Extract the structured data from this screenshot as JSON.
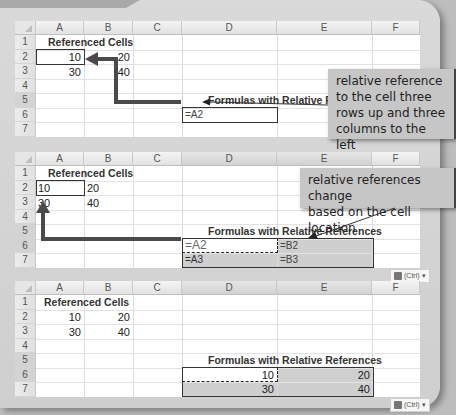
{
  "columns": [
    "A",
    "B",
    "C",
    "D",
    "E",
    "F"
  ],
  "rows": [
    "1",
    "2",
    "3",
    "4",
    "5",
    "6",
    "7"
  ],
  "panel1": {
    "heading": "Referenced Cells",
    "a2": "10",
    "b2": "20",
    "a3": "30",
    "b3": "40",
    "formulas_heading": "Formulas with Relative Refe",
    "d5": "=A2",
    "callout": [
      "relative reference",
      "to the cell three",
      "rows up and three",
      "columns to the left"
    ]
  },
  "panel2": {
    "heading": "Referenced Cells",
    "a2": "10",
    "b2": "20",
    "a3": "30",
    "b3": "40",
    "formulas_heading": "Formulas with Relative References",
    "d5": "=A2",
    "e5": "=B2",
    "d6": "=A3",
    "e6": "=B3",
    "callout": [
      "relative references change",
      "based on the cell location"
    ],
    "paste_options": "(Ctrl)"
  },
  "panel3": {
    "heading": "Referenced Cells",
    "a2": "10",
    "b2": "20",
    "a3": "30",
    "b3": "40",
    "formulas_heading": "Formulas with Relative References",
    "d5": "10",
    "e5": "20",
    "d6": "30",
    "e6": "40",
    "paste_options": "(Ctrl)"
  },
  "colors": {
    "arrow": "#4a4a4a",
    "callout_bg": "#c6c6c6",
    "selection_shade": "#cfcfcf"
  }
}
